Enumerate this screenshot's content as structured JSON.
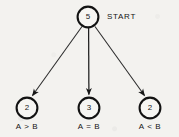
{
  "figure": {
    "title_label": "START",
    "background_color": "#f3f2ef",
    "ink_color": "#141414",
    "start_node": {
      "id": "start",
      "value": "5",
      "cx": 88,
      "cy": 17,
      "r": 11
    },
    "nodes": [
      {
        "id": "greater",
        "value": "2",
        "label": "A > B",
        "cx": 27,
        "cy": 108,
        "r": 11,
        "label_y": 122
      },
      {
        "id": "equal",
        "value": "3",
        "label": "A = B",
        "cx": 89,
        "cy": 108,
        "r": 11,
        "label_y": 122
      },
      {
        "id": "less",
        "value": "2",
        "label": "A < B",
        "cx": 150,
        "cy": 108,
        "r": 11,
        "label_y": 122
      }
    ],
    "edges": [
      {
        "id": "edge-to-greater",
        "from": "start",
        "to": "greater"
      },
      {
        "id": "edge-to-equal",
        "from": "start",
        "to": "equal"
      },
      {
        "id": "edge-to-less",
        "from": "start",
        "to": "less"
      }
    ]
  }
}
